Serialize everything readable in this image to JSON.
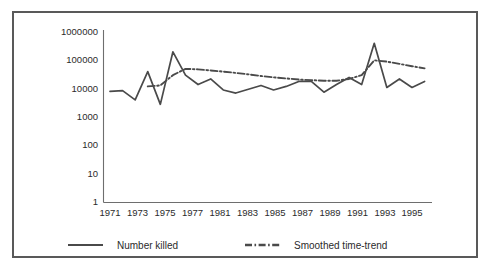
{
  "figure": {
    "frame_color": "#595959",
    "background_color": "#ffffff",
    "line_color": "#4a4a4a",
    "axis_color": "#6e6e6e",
    "text_color": "#2b2b2b"
  },
  "axes": {
    "y_tick_labels": [
      "1000000",
      "100000",
      "10000",
      "1000",
      "100",
      "10",
      "1"
    ],
    "x_tick_labels": [
      "1971",
      "1973",
      "1975",
      "1977",
      "1981",
      "1983",
      "1985",
      "1987",
      "1989",
      "1991",
      "1993",
      "1995"
    ]
  },
  "legend": {
    "entries": [
      {
        "label": "Number killed",
        "style": "solid",
        "swatch_name": "legend-swatch-number-killed"
      },
      {
        "label": "Smoothed time-trend",
        "style": "dash-dot",
        "swatch_name": "legend-swatch-smoothed-time-trend"
      }
    ]
  },
  "chart_data": {
    "type": "line",
    "title": "",
    "subtitle": "",
    "xlabel": "",
    "ylabel": "",
    "yscale": "log",
    "ylim": [
      1,
      1000000
    ],
    "ytick_values": [
      1000000,
      100000,
      10000,
      1000,
      100,
      10,
      1
    ],
    "ytick_labels": [
      "1000000",
      "100000",
      "10000",
      "1000",
      "100",
      "10",
      "1"
    ],
    "xlim": [
      1971,
      1996
    ],
    "xtick_values": [
      1971,
      1973,
      1975,
      1977,
      1981,
      1983,
      1985,
      1987,
      1989,
      1991,
      1993,
      1995
    ],
    "xtick_labels": [
      "1971",
      "1973",
      "1975",
      "1977",
      "1981",
      "1983",
      "1985",
      "1987",
      "1989",
      "1991",
      "1993",
      "1995"
    ],
    "grid": false,
    "legend_position": "below-axes",
    "x": [
      1971,
      1972,
      1973,
      1974,
      1975,
      1976,
      1977,
      1978,
      1979,
      1980,
      1981,
      1982,
      1983,
      1984,
      1985,
      1986,
      1987,
      1988,
      1989,
      1990,
      1991,
      1992,
      1993,
      1994,
      1995,
      1996
    ],
    "series": [
      {
        "name": "Number killed",
        "style": "solid",
        "values": [
          8000,
          8500,
          4000,
          40000,
          2800,
          200000,
          30000,
          14000,
          22000,
          9000,
          7000,
          9500,
          13000,
          9000,
          12000,
          18000,
          18000,
          7500,
          14000,
          25000,
          14000,
          400000,
          11000,
          22000,
          11000,
          18000
        ]
      },
      {
        "name": "Smoothed time-trend",
        "style": "dash-dot",
        "x": [
          1974,
          1975,
          1976,
          1977,
          1978,
          1979,
          1980,
          1981,
          1982,
          1983,
          1984,
          1985,
          1986,
          1987,
          1988,
          1989,
          1990,
          1991,
          1992,
          1993,
          1994,
          1995,
          1996
        ],
        "values": [
          12000,
          13000,
          30000,
          50000,
          48000,
          44000,
          40000,
          36000,
          32000,
          28000,
          25000,
          23000,
          21000,
          20000,
          19000,
          19000,
          22000,
          30000,
          100000,
          90000,
          75000,
          62000,
          52000
        ]
      }
    ]
  }
}
